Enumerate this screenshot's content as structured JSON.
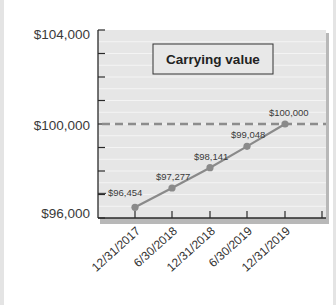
{
  "chart_data": {
    "type": "line",
    "title": "Carrying value",
    "xlabel": "",
    "ylabel": "",
    "categories": [
      "12/31/2017",
      "6/30/2018",
      "12/31/2018",
      "6/30/2019",
      "12/31/2019"
    ],
    "series": [
      {
        "name": "Carrying value",
        "values": [
          96454,
          97277,
          98141,
          99048,
          100000
        ]
      }
    ],
    "data_labels": [
      "$96,454",
      "$97,277",
      "$98,141",
      "$99,048",
      "$100,000"
    ],
    "reference_line": {
      "value": 100000,
      "style": "dashed",
      "meaning": "face value"
    },
    "ylim": [
      96000,
      104000
    ],
    "y_tick_labels": [
      "$104,000",
      "$100,000",
      "$96,000"
    ],
    "grid": true,
    "legend": "none"
  },
  "axis": {
    "y_top": "$104,000",
    "y_mid": "$100,000",
    "y_bottom": "$96,000"
  },
  "colors": {
    "plot_bg": "#e6e6e6",
    "line": "#8a8a8a",
    "dashed": "#8c8c8c",
    "text": "#3a3a3a"
  }
}
